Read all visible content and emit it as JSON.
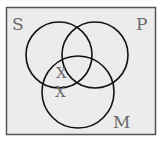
{
  "diagram": {
    "type": "venn",
    "sets": [
      {
        "label": "S",
        "cx": 59,
        "cy": 55,
        "r": 33
      },
      {
        "label": "P",
        "cx": 95,
        "cy": 55,
        "r": 33
      },
      {
        "label": "M",
        "cx": 78,
        "cy": 92,
        "r": 36
      }
    ],
    "marks": [
      {
        "label": "X",
        "x": 62,
        "y": 80
      },
      {
        "label": "X",
        "x": 61,
        "y": 99
      }
    ],
    "colors": {
      "background": "#ffffff",
      "box_fill": "#ececec",
      "stroke": "#111111",
      "text": "#6a6a6a"
    }
  }
}
